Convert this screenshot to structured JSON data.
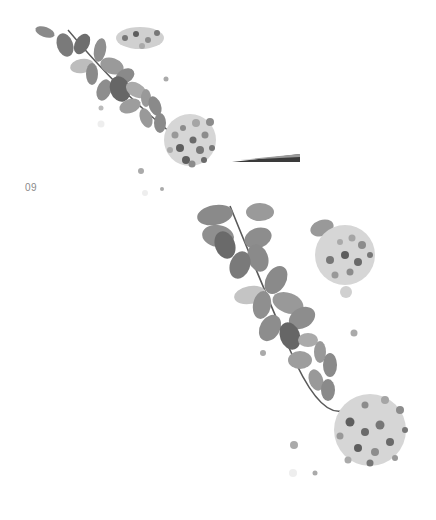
{
  "page": {
    "page_number": "09",
    "background": "#ffffff"
  },
  "illustrations": [
    {
      "id": "top",
      "description": "Watercolor branch of oval leaves with a flower cluster, with a paintbrush tip",
      "elements": [
        "leaf-branch",
        "flower-cluster",
        "flower-cluster-partial",
        "paintbrush",
        "paint-dots"
      ]
    },
    {
      "id": "bottom",
      "description": "Enlarged watercolor branch of oval leaves with two flower clusters",
      "elements": [
        "leaf-branch",
        "flower-cluster",
        "flower-cluster",
        "paint-dots"
      ]
    }
  ],
  "colors": {
    "leaf_dark": "#6f6f6f",
    "leaf_mid": "#9a9a9a",
    "leaf_light": "#c4c4c4",
    "flower_dark": "#5e5e5e",
    "flower_mid": "#8c8c8c",
    "flower_light": "#bdbdbd",
    "stem": "#5a5a5a",
    "brush": "#3a3a3a"
  }
}
